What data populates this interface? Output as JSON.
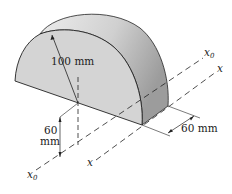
{
  "figure": {
    "type": "semicylinder-isometric",
    "labels": {
      "radius": "100 mm",
      "height_top": "60",
      "height_bottom": "mm",
      "depth": "60 mm",
      "axis_x0_right": "x",
      "axis_x0_right_sub": "0",
      "axis_x_right": "x",
      "axis_x_bottom": "x",
      "axis_x0_bottom": "x",
      "axis_x0_bottom_sub": "0"
    },
    "colors": {
      "front_face": "#d4d4d4",
      "curved_surface_light": "#e8e8e8",
      "curved_surface_dark": "#a8a8a8",
      "lines": "#222222"
    }
  }
}
